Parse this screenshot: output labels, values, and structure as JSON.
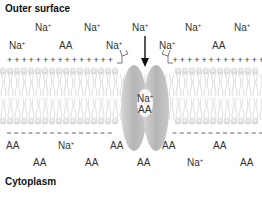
{
  "title_top": "Outer surface",
  "title_bottom": "Cytoplasm",
  "ion": {
    "base": "Na",
    "charge": "+"
  },
  "amino_acid": "AA",
  "channel_contents": {
    "ion": "Na",
    "charge": "+",
    "aa": "AA"
  },
  "outer_labels": [
    {
      "text": "Na",
      "sup": "+",
      "x": 35,
      "y": 22
    },
    {
      "text": "Na",
      "sup": "+",
      "x": 84,
      "y": 22
    },
    {
      "text": "Na",
      "sup": "+",
      "x": 132,
      "y": 22
    },
    {
      "text": "Na",
      "sup": "+",
      "x": 185,
      "y": 22
    },
    {
      "text": "Na",
      "sup": "+",
      "x": 234,
      "y": 22
    },
    {
      "text": "Na",
      "sup": "+",
      "x": 9,
      "y": 40
    },
    {
      "text": "AA",
      "sup": "",
      "x": 59,
      "y": 40
    },
    {
      "text": "Na",
      "sup": "+",
      "x": 106,
      "y": 40
    },
    {
      "text": "Na",
      "sup": "+",
      "x": 159,
      "y": 40
    },
    {
      "text": "AA",
      "sup": "",
      "x": 212,
      "y": 40
    }
  ],
  "inner_labels": [
    {
      "text": "AA",
      "sup": "",
      "x": 6,
      "y": 140
    },
    {
      "text": "Na",
      "sup": "+",
      "x": 58,
      "y": 140
    },
    {
      "text": "AA",
      "sup": "",
      "x": 110,
      "y": 140
    },
    {
      "text": "AA",
      "sup": "",
      "x": 162,
      "y": 140
    },
    {
      "text": "AA",
      "sup": "",
      "x": 213,
      "y": 140
    },
    {
      "text": "AA",
      "sup": "",
      "x": 33,
      "y": 157
    },
    {
      "text": "AA",
      "sup": "",
      "x": 85,
      "y": 157
    },
    {
      "text": "AA",
      "sup": "",
      "x": 137,
      "y": 157
    },
    {
      "text": "Na",
      "sup": "+",
      "x": 187,
      "y": 157
    },
    {
      "text": "AA",
      "sup": "",
      "x": 240,
      "y": 157
    }
  ],
  "charges": {
    "outer": "+",
    "inner": "-"
  },
  "colors": {
    "membrane": "#d9d9d9",
    "protein": "#bdbdbd",
    "text": "#333333"
  }
}
